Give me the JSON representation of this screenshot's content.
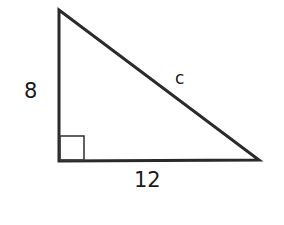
{
  "diagram": {
    "type": "right-triangle",
    "shape": "right triangle",
    "vertices": {
      "top": [
        59,
        10
      ],
      "right_angle": [
        59,
        161
      ],
      "right": [
        259,
        160
      ]
    },
    "right_angle_marker": {
      "x": 59,
      "y": 136,
      "size": 25
    },
    "labels": {
      "vertical_leg": "8",
      "horizontal_leg": "12",
      "hypotenuse": "c"
    },
    "stroke_color": "#2a2a2a",
    "label_color": "#1a1a1a"
  }
}
